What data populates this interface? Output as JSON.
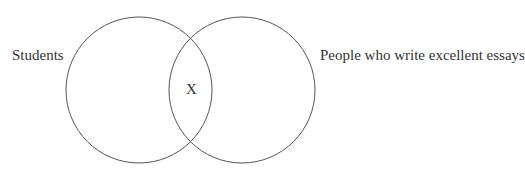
{
  "diagram": {
    "type": "venn",
    "sets": [
      {
        "label": "Students",
        "cx": 139,
        "cy": 90,
        "r": 73
      },
      {
        "label": "People who write excellent essays",
        "cx": 242,
        "cy": 90,
        "r": 73
      }
    ],
    "intersection_label": "X",
    "stroke_color": "#555555"
  }
}
